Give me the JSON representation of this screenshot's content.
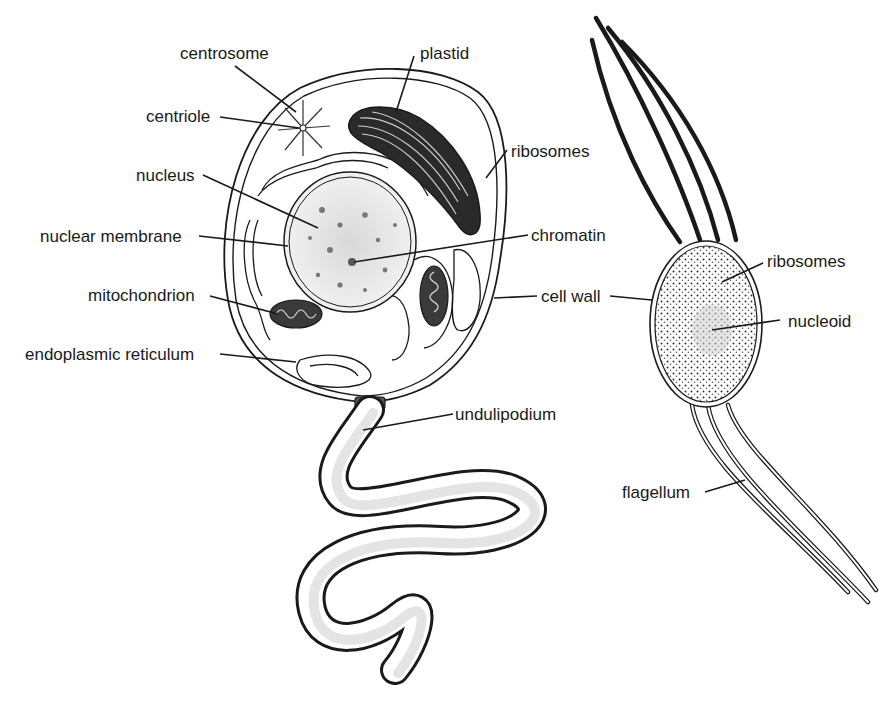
{
  "diagram": {
    "type": "biology-comparison",
    "cells": [
      {
        "id": "eukaryote",
        "description": "nucleated cell with undulipodium",
        "labels": [
          {
            "key": "centrosome",
            "text": "centrosome"
          },
          {
            "key": "centriole",
            "text": "centriole"
          },
          {
            "key": "nucleus",
            "text": "nucleus"
          },
          {
            "key": "nuclear_membrane",
            "text": "nuclear membrane"
          },
          {
            "key": "mitochondrion",
            "text": "mitochondrion"
          },
          {
            "key": "endoplasmic_reticulum",
            "text": "endoplasmic reticulum"
          },
          {
            "key": "plastid",
            "text": "plastid"
          },
          {
            "key": "ribosomes",
            "text": "ribosomes"
          },
          {
            "key": "chromatin",
            "text": "chromatin"
          },
          {
            "key": "undulipodium",
            "text": "undulipodium"
          }
        ]
      },
      {
        "id": "prokaryote",
        "description": "bacterial cell with flagella",
        "labels": [
          {
            "key": "ribosomes",
            "text": "ribosomes"
          },
          {
            "key": "nucleoid",
            "text": "nucleoid"
          },
          {
            "key": "flagellum",
            "text": "flagellum"
          }
        ]
      }
    ],
    "shared_labels": [
      {
        "key": "cell_wall",
        "text": "cell wall"
      }
    ]
  },
  "labels": {
    "centrosome": "centrosome",
    "centriole": "centriole",
    "nucleus": "nucleus",
    "nuclear_membrane": "nuclear membrane",
    "mitochondrion": "mitochondrion",
    "endoplasmic_reticulum": "endoplasmic reticulum",
    "plastid": "plastid",
    "ribosomes_euk": "ribosomes",
    "chromatin": "chromatin",
    "cell_wall": "cell wall",
    "undulipodium": "undulipodium",
    "ribosomes_prok": "ribosomes",
    "nucleoid": "nucleoid",
    "flagellum": "flagellum"
  },
  "colors": {
    "ink": "#1a1a1a",
    "background": "#ffffff",
    "plastid_fill": "#2a2a2a",
    "nucleus_fill": "#ececec"
  }
}
